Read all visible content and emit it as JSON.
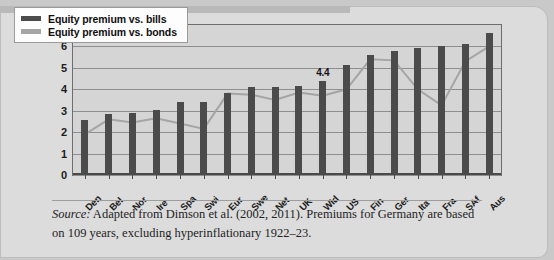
{
  "figure": {
    "caption_source_label": "Source:",
    "caption_text": " Adapted from Dimson et al. (2002, 2011). Premiums for Germany are based on 109 years, excluding hyperinflationary 1922–23."
  },
  "legend": {
    "position": "top-left",
    "items": [
      {
        "label": "Equity premium vs. bills",
        "color": "#4b4b4b"
      },
      {
        "label": "Equity premium vs. bonds",
        "color": "#a5a5a5"
      }
    ]
  },
  "chart_data": {
    "type": "bar",
    "title": "",
    "subtitle": "",
    "xlabel": "",
    "ylabel": "",
    "ylim": [
      0,
      7
    ],
    "yticks": [
      0,
      1,
      2,
      3,
      4,
      5,
      6
    ],
    "ytick_labels": [
      "0",
      "1",
      "2",
      "3",
      "4",
      "5",
      "6"
    ],
    "grid": true,
    "categories": [
      "Den",
      "Bel",
      "Nor",
      "Ire",
      "Spa",
      "Swi",
      "Eur",
      "Swe",
      "Net",
      "UK",
      "Wld",
      "US",
      "Fin",
      "Ger",
      "Ita",
      "Fra",
      "SAf",
      "Aus"
    ],
    "series": [
      {
        "name": "Equity premium vs. bills",
        "type": "bar",
        "color": "#4b4b4b",
        "values": [
          2.55,
          2.85,
          2.9,
          3.02,
          3.4,
          3.4,
          3.85,
          4.1,
          4.1,
          4.15,
          4.4,
          5.15,
          5.6,
          5.8,
          5.95,
          6.0,
          6.1,
          6.65
        ]
      },
      {
        "name": "Equity premium vs. bonds",
        "type": "line",
        "color": "#a5a5a5",
        "values": [
          1.9,
          2.6,
          2.45,
          2.65,
          2.4,
          2.15,
          3.8,
          3.75,
          3.5,
          3.85,
          3.7,
          4.0,
          5.4,
          5.35,
          4.0,
          3.25,
          5.3,
          6.0
        ]
      }
    ],
    "annotations": [
      {
        "text": "4.4",
        "category": "Wld",
        "value": 4.4,
        "series": "Equity premium vs. bills"
      }
    ]
  }
}
